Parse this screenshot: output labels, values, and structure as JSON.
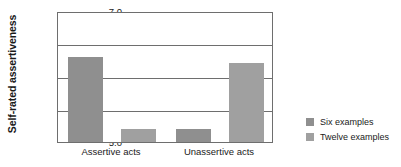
{
  "chart_data": {
    "type": "bar",
    "title": "",
    "subtitle": "",
    "xlabel": "",
    "ylabel": "Self-rated assertiveness",
    "categories": [
      "Assertive acts",
      "Unassertive acts"
    ],
    "series": [
      {
        "name": "Six examples",
        "values": [
          6.3,
          5.2
        ],
        "color": "#8f8f8f"
      },
      {
        "name": "Twelve examples",
        "values": [
          5.2,
          6.2
        ],
        "color": "#a0a0a0"
      }
    ],
    "ylim": [
      5.0,
      7.0
    ],
    "yticks": [
      "5.0",
      "5.5",
      "6.0",
      "6.5",
      "7.0"
    ],
    "ytick_values": [
      5.0,
      5.5,
      6.0,
      6.5,
      7.0
    ],
    "grid": true,
    "grid_axis": "y",
    "legend_position": "right",
    "frame": true,
    "background_color": "#ffffff",
    "axis_color": "#6e6e6e"
  },
  "legend": {
    "entries": [
      {
        "label": "Six examples",
        "swatch": "#8f8f8f"
      },
      {
        "label": "Twelve examples",
        "swatch": "#a0a0a0"
      }
    ]
  }
}
